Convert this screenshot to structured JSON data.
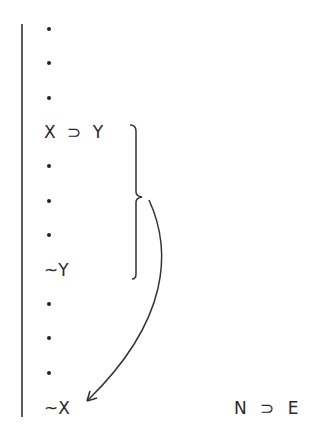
{
  "proof": {
    "lines": [
      {
        "kind": "dot",
        "text": "."
      },
      {
        "kind": "dot",
        "text": "."
      },
      {
        "kind": "dot",
        "text": "."
      },
      {
        "kind": "formula",
        "text": "X ⊃ Y"
      },
      {
        "kind": "dot",
        "text": "."
      },
      {
        "kind": "dot",
        "text": "."
      },
      {
        "kind": "dot",
        "text": "."
      },
      {
        "kind": "formula",
        "text": "~Y"
      },
      {
        "kind": "dot",
        "text": "."
      },
      {
        "kind": "dot",
        "text": "."
      },
      {
        "kind": "dot",
        "text": "."
      },
      {
        "kind": "formula",
        "text": "~X"
      }
    ],
    "bracket_span": {
      "from": "X ⊃ Y",
      "to": "~Y"
    },
    "arrow": {
      "from": "bracket",
      "to": "~X"
    }
  },
  "rule_label": "N ⊃ E"
}
